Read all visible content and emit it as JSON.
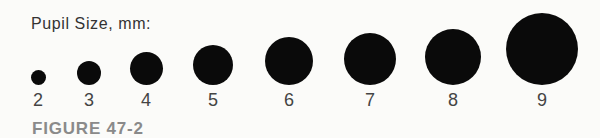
{
  "title": "Pupil Size, mm:",
  "figure_label": "FIGURE 47-2",
  "pupils": [
    {
      "label": "2",
      "cx": 38,
      "d": 15
    },
    {
      "label": "3",
      "cx": 89,
      "d": 24
    },
    {
      "label": "4",
      "cx": 146,
      "d": 33
    },
    {
      "label": "5",
      "cx": 213,
      "d": 40
    },
    {
      "label": "6",
      "cx": 289,
      "d": 48
    },
    {
      "label": "7",
      "cx": 370,
      "d": 52
    },
    {
      "label": "8",
      "cx": 453,
      "d": 56
    },
    {
      "label": "9",
      "cx": 542,
      "d": 72
    }
  ],
  "colors": {
    "pupil": "#0a0a0a",
    "label": "#444444",
    "figure": "#8a8a8a"
  }
}
